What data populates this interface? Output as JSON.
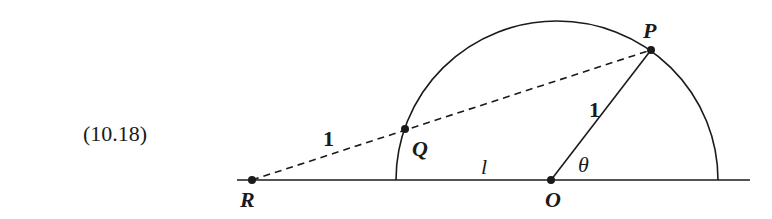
{
  "figure": {
    "equation_number": "(10.18)",
    "points": {
      "R": {
        "label": "R",
        "x": 252,
        "y": 180
      },
      "Q": {
        "label": "Q",
        "x": 405,
        "y": 129
      },
      "O": {
        "label": "O",
        "x": 551,
        "y": 180
      },
      "P": {
        "label": "P",
        "x": 651,
        "y": 50
      }
    },
    "segment_labels": {
      "RQ": "1",
      "OP": "1",
      "baseline": "l",
      "angle": "θ"
    },
    "colors": {
      "ink": "#1a1a1a",
      "background": "#ffffff"
    }
  }
}
